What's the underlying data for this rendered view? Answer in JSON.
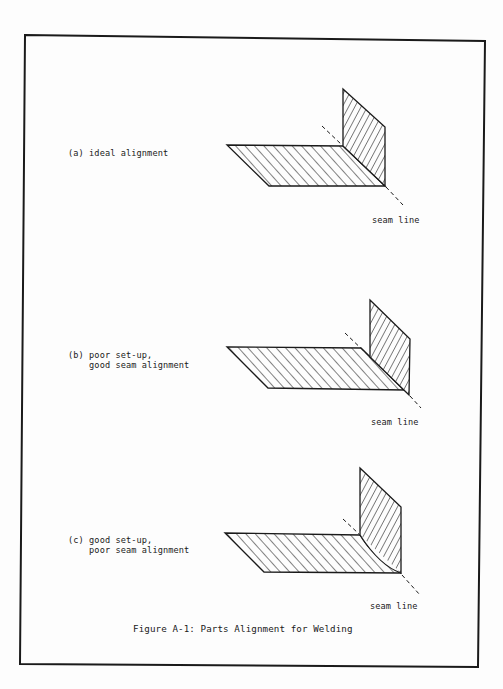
{
  "figure": {
    "caption": "Figure A-1: Parts Alignment for Welding",
    "stroke_color": "#1a1a1a",
    "background": "#fdfdfd",
    "panels": [
      {
        "id": "a",
        "label_line1": "(a) ideal alignment",
        "label_line2": "",
        "seam_label": "seam line",
        "condition": "ideal alignment"
      },
      {
        "id": "b",
        "label_line1": "(b) poor set-up,",
        "label_line2": "    good seam alignment",
        "seam_label": "seam line",
        "condition": "poor set-up, good seam alignment"
      },
      {
        "id": "c",
        "label_line1": "(c) good set-up,",
        "label_line2": "    poor seam alignment",
        "seam_label": "seam line",
        "condition": "good set-up, poor seam alignment"
      }
    ]
  }
}
